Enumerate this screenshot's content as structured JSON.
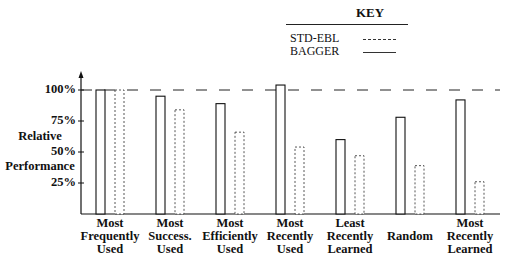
{
  "key": {
    "title": "KEY",
    "entries": [
      {
        "label": "STD-EBL",
        "style": "dashed"
      },
      {
        "label": "BAGGER",
        "style": "solid"
      }
    ]
  },
  "axis": {
    "y_label_line1": "Relative",
    "y_label_line2": "Performance",
    "ticks": [
      "100%",
      "75%",
      "50%",
      "25%"
    ]
  },
  "categories": [
    {
      "line1": "Most",
      "line2": "Frequently",
      "line3": "Used"
    },
    {
      "line1": "Most",
      "line2": "Success.",
      "line3": "Used"
    },
    {
      "line1": "Most",
      "line2": "Efficiently",
      "line3": "Used"
    },
    {
      "line1": "Most",
      "line2": "Recently",
      "line3": "Used"
    },
    {
      "line1": "Least",
      "line2": "Recently",
      "line3": "Learned"
    },
    {
      "line1": "",
      "line2": "Random",
      "line3": ""
    },
    {
      "line1": "Most",
      "line2": "Recently",
      "line3": "Learned"
    }
  ],
  "chart_data": {
    "type": "bar",
    "title": "",
    "xlabel": "",
    "ylabel": "Relative Performance",
    "ylim": [
      0,
      110
    ],
    "yticks": [
      25,
      50,
      75,
      100
    ],
    "reference_line": {
      "y": 100,
      "style": "dashed"
    },
    "grid": false,
    "legend_position": "top-right",
    "categories": [
      "Most Frequently Used",
      "Most Success. Used",
      "Most Efficiently Used",
      "Most Recently Used",
      "Least Recently Learned",
      "Random",
      "Most Recently Learned"
    ],
    "series": [
      {
        "name": "BAGGER",
        "line_style": "solid",
        "values": [
          100,
          95,
          89,
          104,
          60,
          78,
          92
        ]
      },
      {
        "name": "STD-EBL",
        "line_style": "dashed",
        "values": [
          100,
          84,
          66,
          54,
          47,
          39,
          26
        ]
      }
    ]
  }
}
